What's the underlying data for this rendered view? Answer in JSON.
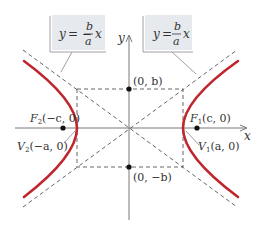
{
  "diagram": {
    "type": "hyperbola",
    "colors": {
      "curve": "#c0262d",
      "axis": "#6a6a6a",
      "dashed": "#555555",
      "label_box": "#e6eaee",
      "text": "#333333"
    },
    "axes": {
      "x_label": "x",
      "y_label": "y"
    },
    "asymptote_labels": {
      "left": {
        "lhs": "y = −",
        "num": "b",
        "den": "a",
        "var": "x"
      },
      "right": {
        "lhs": "y = ",
        "num": "b",
        "den": "a",
        "var": "x"
      }
    },
    "points": {
      "top": "(0, b)",
      "bottom": "(0, −b)",
      "focus_right": {
        "name": "F",
        "sub": "1",
        "coords": "(c, 0)"
      },
      "focus_left": {
        "name": "F",
        "sub": "2",
        "coords": "(−c, 0)"
      },
      "vertex_right": {
        "name": "V",
        "sub": "1",
        "coords": "(a, 0)"
      },
      "vertex_left": {
        "name": "V",
        "sub": "2",
        "coords": "(−a, 0)"
      }
    }
  }
}
